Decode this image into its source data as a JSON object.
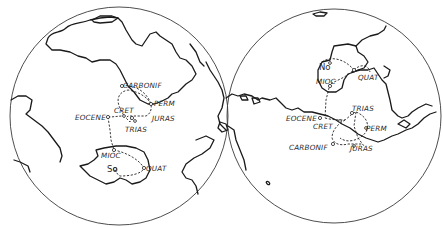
{
  "figure": {
    "left_globe": {
      "hemisphere": "southern / Africa-Antarctica",
      "path_labels": {
        "carbonif": "CARBONIF",
        "perm": "PERM",
        "cret": "CRET",
        "juras": "JURAS",
        "trias": "TRIAS",
        "eocene": "EOCENE",
        "mioc": "MIOC",
        "quat": "QUAT"
      },
      "pole_label": "So"
    },
    "right_globe": {
      "hemisphere": "northern / Eurasia",
      "path_labels": {
        "trias": "TRIAS",
        "eocene": "EOCENE",
        "cret": "CRET",
        "perm": "PERM",
        "carbonif": "CARBONIF",
        "juras": "JURAS",
        "mioc": "MIOC",
        "quat": "QUAT"
      },
      "pole_label": "No"
    }
  }
}
